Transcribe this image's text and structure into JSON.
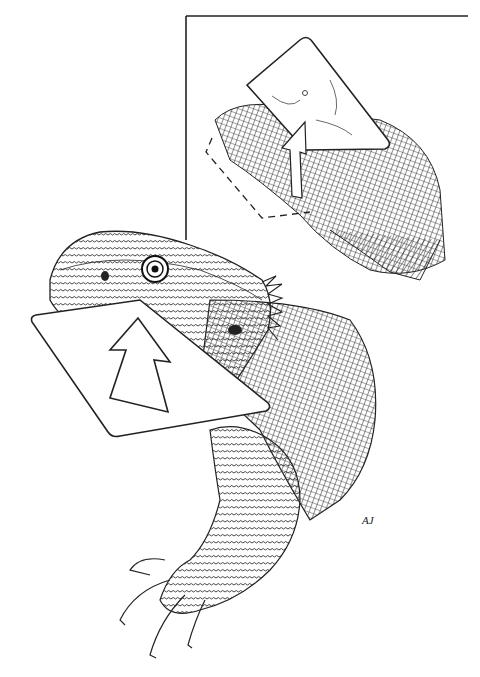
{
  "illustration": {
    "subject": "bearded dragon holding a card with an upward arrow",
    "style": "pen-and-ink crosshatch",
    "ink_color": "#1a1a1a",
    "paper_color": "#ffffff",
    "inset": {
      "description": "inset panel showing head with card and arrow, dashed outline of card position",
      "border_color": "#222222"
    },
    "card": {
      "fill": "#ffffff",
      "arrow_direction": "up"
    },
    "signature": "AJ"
  },
  "caption": {
    "text": ""
  }
}
